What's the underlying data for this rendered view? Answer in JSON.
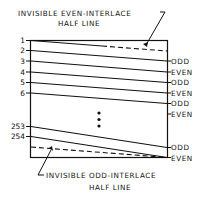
{
  "diagram": {
    "top_annotation": {
      "line1": "INVISIBLE EVEN-INTERLACE",
      "line2": "HALF LINE"
    },
    "bottom_annotation": {
      "line1": "INVISIBLE ODD-INTERLACE",
      "line2": "HALF LINE"
    },
    "left_labels": [
      {
        "text": "1",
        "y": 41
      },
      {
        "text": "2",
        "y": 51
      },
      {
        "text": "3",
        "y": 62
      },
      {
        "text": "4",
        "y": 73
      },
      {
        "text": "5",
        "y": 84
      },
      {
        "text": "6",
        "y": 94
      },
      {
        "text": "253",
        "y": 128
      },
      {
        "text": "254",
        "y": 138
      }
    ],
    "right_labels": [
      {
        "text": "ODD",
        "y": 63
      },
      {
        "text": "EVEN",
        "y": 74
      },
      {
        "text": "ODD",
        "y": 84
      },
      {
        "text": "EVEN",
        "y": 95
      },
      {
        "text": "ODD",
        "y": 105
      },
      {
        "text": "EVEN",
        "y": 115
      },
      {
        "text": "ODD",
        "y": 149
      },
      {
        "text": "EVEN",
        "y": 160
      }
    ],
    "ellipsis": "⋮",
    "colors": {
      "ink": "#111111",
      "background": "#ffffff"
    }
  }
}
